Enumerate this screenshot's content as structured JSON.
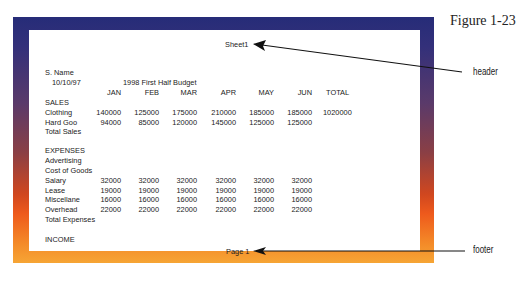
{
  "figure_label": "Figure 1-23",
  "callouts": {
    "header": "header",
    "footer": "footer"
  },
  "page": {
    "header_text": "Sheet1",
    "footer_text": "Page 1",
    "name": "S. Name",
    "date": "10/10/97",
    "title": "1998 First Half Budget",
    "columns": [
      "JAN",
      "FEB",
      "MAR",
      "APR",
      "MAY",
      "JUN",
      "TOTAL"
    ],
    "sections": {
      "sales": "SALES",
      "total_sales": "Total Sales",
      "expenses": "EXPENSES",
      "total_expenses": "Total Expenses",
      "income": "INCOME"
    },
    "rows": {
      "clothing": {
        "label": "Clothing",
        "values": [
          "140000",
          "125000",
          "175000",
          "210000",
          "185000",
          "185000",
          "1020000"
        ]
      },
      "hard_goods": {
        "label": "Hard Goo",
        "values": [
          "94000",
          "85000",
          "120000",
          "145000",
          "125000",
          "125000"
        ]
      },
      "advertising": {
        "label": "Advertising"
      },
      "cost_of_goods": {
        "label": "Cost of Goods"
      },
      "salary": {
        "label": "Salary",
        "values": [
          "32000",
          "32000",
          "32000",
          "32000",
          "32000",
          "32000"
        ]
      },
      "lease": {
        "label": "Lease",
        "values": [
          "19000",
          "19000",
          "19000",
          "19000",
          "19000",
          "19000"
        ]
      },
      "miscellaneous": {
        "label": "Miscellane",
        "values": [
          "16000",
          "16000",
          "16000",
          "16000",
          "16000",
          "16000"
        ]
      },
      "overhead": {
        "label": "Overhead",
        "values": [
          "22000",
          "22000",
          "22000",
          "22000",
          "22000",
          "22000"
        ]
      }
    }
  },
  "colors": {
    "frame_top": "#262c78",
    "frame_mid": "#e8501e",
    "frame_bottom": "#f6a535"
  }
}
